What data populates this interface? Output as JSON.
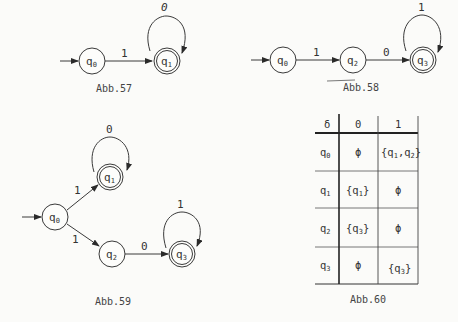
{
  "figures": {
    "abb57": {
      "caption": "Abb.57",
      "states": [
        {
          "id": "q0",
          "label": "q",
          "sub": "0",
          "accepting": false,
          "initial": true
        },
        {
          "id": "q1",
          "label": "q",
          "sub": "1",
          "accepting": true,
          "initial": false
        }
      ],
      "transitions": [
        {
          "from": "q0",
          "to": "q1",
          "symbol": "1"
        },
        {
          "from": "q1",
          "to": "q1",
          "symbol": "0"
        }
      ]
    },
    "abb58": {
      "caption": "Abb.58",
      "states": [
        {
          "id": "q0",
          "label": "q",
          "sub": "0",
          "accepting": false,
          "initial": true
        },
        {
          "id": "q2",
          "label": "q",
          "sub": "2",
          "accepting": false,
          "initial": false
        },
        {
          "id": "q3",
          "label": "q",
          "sub": "3",
          "accepting": true,
          "initial": false
        }
      ],
      "transitions": [
        {
          "from": "q0",
          "to": "q2",
          "symbol": "1"
        },
        {
          "from": "q2",
          "to": "q3",
          "symbol": "0"
        },
        {
          "from": "q3",
          "to": "q3",
          "symbol": "1"
        }
      ]
    },
    "abb59": {
      "caption": "Abb.59",
      "states": [
        {
          "id": "q0",
          "label": "q",
          "sub": "0",
          "accepting": false,
          "initial": true
        },
        {
          "id": "q1",
          "label": "q",
          "sub": "1",
          "accepting": true,
          "initial": false
        },
        {
          "id": "q2",
          "label": "q",
          "sub": "2",
          "accepting": false,
          "initial": false
        },
        {
          "id": "q3",
          "label": "q",
          "sub": "3",
          "accepting": true,
          "initial": false
        }
      ],
      "transitions": [
        {
          "from": "q0",
          "to": "q1",
          "symbol": "1"
        },
        {
          "from": "q1",
          "to": "q1",
          "symbol": "0"
        },
        {
          "from": "q0",
          "to": "q2",
          "symbol": "1"
        },
        {
          "from": "q2",
          "to": "q3",
          "symbol": "0"
        },
        {
          "from": "q3",
          "to": "q3",
          "symbol": "1"
        }
      ]
    },
    "abb60": {
      "caption": "Abb.60",
      "header": [
        "δ",
        "0",
        "1"
      ],
      "rows": [
        {
          "state": "q",
          "sub": "0",
          "c0": "ϕ",
          "c1": "{q1,q2}"
        },
        {
          "state": "q",
          "sub": "1",
          "c0": "{q1}",
          "c1": "ϕ"
        },
        {
          "state": "q",
          "sub": "2",
          "c0": "{q3}",
          "c1": "ϕ"
        },
        {
          "state": "q",
          "sub": "3",
          "c0": "ϕ",
          "c1": "{q3}"
        }
      ]
    }
  },
  "sym": {
    "one": "1",
    "zero": "0",
    "q": "q",
    "phi": "ϕ",
    "lb": "{",
    "rb": "}",
    "comma": ","
  }
}
